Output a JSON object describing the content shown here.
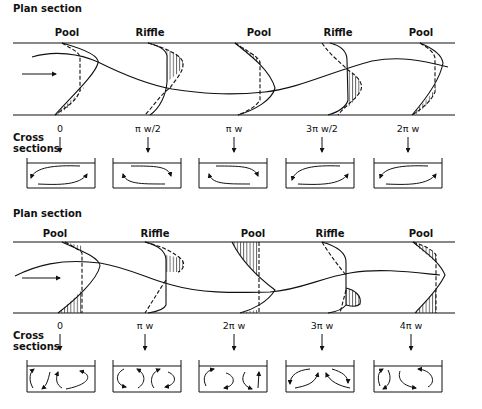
{
  "panels": [
    {
      "title": "Plan section",
      "reaches": [
        "Pool",
        "Riffle",
        "Pool",
        "Riffle",
        "Pool"
      ],
      "cross_label": "Cross\nsections",
      "cross_label_lines": [
        "Cross",
        "sections"
      ],
      "cross_sections": [
        "0",
        "π w/2",
        "π w",
        "3π w/2",
        "2π w"
      ],
      "circulation": "single-cell alternating"
    },
    {
      "title": "Plan section",
      "reaches": [
        "Pool",
        "Riffle",
        "Pool",
        "Riffle",
        "Pool"
      ],
      "cross_label": "Cross\nsections",
      "cross_label_lines": [
        "Cross",
        "sections"
      ],
      "cross_sections": [
        "0",
        "π w",
        "2π w",
        "3π w",
        "4π w"
      ],
      "circulation": "two-cell"
    }
  ],
  "icons": {
    "flow_arrow": "right-arrow-icon",
    "section_marker": "down-arrow-icon"
  },
  "colors": {
    "ink": "#111111",
    "background": "#ffffff"
  }
}
